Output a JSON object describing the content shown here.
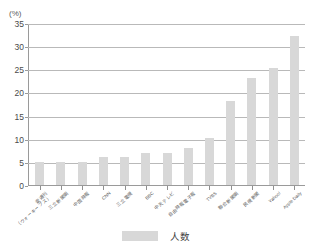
{
  "chart_data": {
    "type": "bar",
    "title": "",
    "subtitle": "",
    "xlabel": "",
    "ylabel": "(%)",
    "unit_label": "(%)",
    "ylim": [
      0,
      35
    ],
    "ytick_values": [
      0,
      5,
      10,
      15,
      20,
      25,
      30,
      35
    ],
    "ytick_labels": [
      "0",
      "5",
      "10",
      "15",
      "20",
      "25",
      "30",
      "35"
    ],
    "grid": true,
    "legend_position": "bottom",
    "legend": [
      "人数"
    ],
    "categories": [
      "壹週刊（ウォーキーブス）",
      "三立新聞網",
      "中国時報",
      "CNN",
      "三立電視",
      "BBC",
      "中天テレビ",
      "自由時報電子報",
      "TVBS",
      "聯合新聞網",
      "民視新聞",
      "Yahoo!",
      "Apple Daily"
    ],
    "categories_display": [
      {
        "l1": "壹週刊",
        "l2": "（ウォーキーブス）"
      },
      {
        "l1": "三立新聞網",
        "l2": ""
      },
      {
        "l1": "中国時報",
        "l2": ""
      },
      {
        "l1": "CNN",
        "l2": ""
      },
      {
        "l1": "三立電視",
        "l2": ""
      },
      {
        "l1": "BBC",
        "l2": ""
      },
      {
        "l1": "中天テレビ",
        "l2": ""
      },
      {
        "l1": "自由時報電子報",
        "l2": ""
      },
      {
        "l1": "TVBS",
        "l2": ""
      },
      {
        "l1": "聯合新聞網",
        "l2": ""
      },
      {
        "l1": "民視新聞",
        "l2": ""
      },
      {
        "l1": "Yahoo!",
        "l2": ""
      },
      {
        "l1": "Apple Daily",
        "l2": ""
      }
    ],
    "series": [
      {
        "name": "人数",
        "color": "#d8d8d8",
        "values": [
          5.0,
          5.0,
          5.0,
          6.0,
          6.0,
          7.0,
          7.0,
          8.0,
          10.1,
          18.2,
          23.1,
          25.3,
          32.2
        ]
      }
    ]
  },
  "legend": {
    "label": "人数"
  }
}
